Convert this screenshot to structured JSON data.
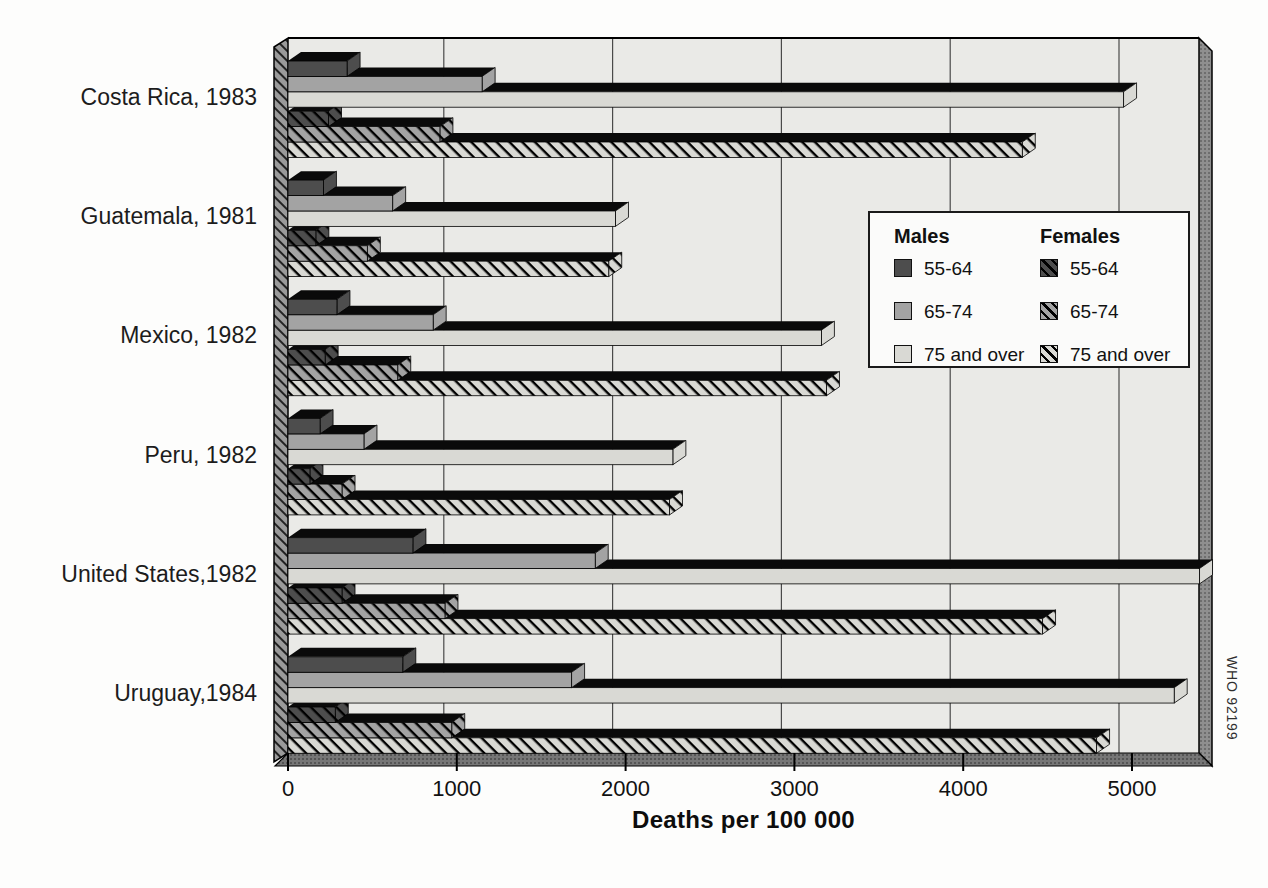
{
  "watermark": "WHO 92199",
  "colors": {
    "male_55_64": "#4d4d4d",
    "male_65_74": "#a3a3a3",
    "male_75_over": "#d9d9d4",
    "plot_background": "#eaeae7",
    "left_wall": "#9a9a9a",
    "right_wall": "#8f8f8f",
    "floor": "#767676",
    "gridline": "#4a4a4a",
    "bar_top": "#0a0a0a"
  },
  "legend": {
    "males_title": "Males",
    "females_title": "Females",
    "age_groups": [
      "55-64",
      "65-74",
      "75 and over"
    ]
  },
  "chart_data": {
    "type": "bar",
    "orientation": "horizontal",
    "title": "",
    "xlabel": "Deaths per 100 000",
    "ylabel": "",
    "xlim": [
      0,
      5400
    ],
    "xticks": [
      0,
      1000,
      2000,
      3000,
      4000,
      5000
    ],
    "grid": true,
    "legend_position": "upper right",
    "style": "3d-horizontal-bars",
    "categories": [
      "Costa Rica, 1983",
      "Guatemala, 1981",
      "Mexico, 1982",
      "Peru, 1982",
      "United States,1982",
      "Uruguay,1984"
    ],
    "series": [
      {
        "name": "Males 55-64",
        "group": "Males",
        "age": "55-64",
        "pattern": "solid",
        "color": "#4d4d4d",
        "values": [
          350,
          210,
          290,
          190,
          740,
          680
        ]
      },
      {
        "name": "Males 65-74",
        "group": "Males",
        "age": "65-74",
        "pattern": "solid",
        "color": "#a3a3a3",
        "values": [
          1150,
          620,
          860,
          450,
          1820,
          1680
        ]
      },
      {
        "name": "Males 75 and over",
        "group": "Males",
        "age": "75 and over",
        "pattern": "solid",
        "color": "#d9d9d4",
        "values": [
          4950,
          1940,
          3160,
          2280,
          5400,
          5250
        ]
      },
      {
        "name": "Females 55-64",
        "group": "Females",
        "age": "55-64",
        "pattern": "hatch",
        "color": "#4d4d4d",
        "values": [
          240,
          165,
          220,
          130,
          320,
          280
        ]
      },
      {
        "name": "Females 65-74",
        "group": "Females",
        "age": "65-74",
        "pattern": "hatch",
        "color": "#a3a3a3",
        "values": [
          900,
          470,
          650,
          320,
          930,
          970
        ]
      },
      {
        "name": "Females 75 and over",
        "group": "Females",
        "age": "75 and over",
        "pattern": "hatch",
        "color": "#d9d9d4",
        "values": [
          4350,
          1900,
          3190,
          2260,
          4470,
          4790
        ]
      }
    ]
  }
}
